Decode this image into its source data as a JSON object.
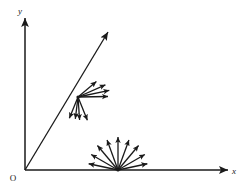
{
  "figure": {
    "kind": "vector-field-diagram",
    "width": 240,
    "height": 189,
    "background_color": "#ffffff",
    "stroke_color": "#1a1a1a"
  },
  "labels": {
    "y_axis": "y",
    "x_axis": "x",
    "origin": "O"
  },
  "chart_data": {
    "type": "scatter",
    "title": "",
    "xlabel": "x",
    "ylabel": "y",
    "grid": false,
    "legend": null,
    "axes": {
      "origin_px": [
        25,
        170
      ],
      "x_axis_end_px": [
        228,
        170
      ],
      "y_axis_end_px": [
        25,
        18
      ],
      "arrowheads": [
        "x-axis-end",
        "y-axis-end"
      ],
      "origin_label": "O",
      "x_tick_labels": [],
      "y_tick_labels": []
    },
    "annotations": [
      {
        "name": "diagonal-ray",
        "type": "arrow",
        "from_px": [
          25,
          170
        ],
        "to_px": [
          108,
          32
        ],
        "angle_deg": 59,
        "has_arrowhead": true
      }
    ],
    "series": [
      {
        "name": "upper-vector-fan",
        "vertex_px": [
          78,
          97
        ],
        "on_annotation": "diagonal-ray",
        "count": 8,
        "vectors": [
          {
            "angle_deg": 40,
            "length_px": 24
          },
          {
            "angle_deg": 24,
            "length_px": 30
          },
          {
            "angle_deg": 12,
            "length_px": 32
          },
          {
            "angle_deg": 1,
            "length_px": 30
          },
          {
            "angle_deg": 248,
            "length_px": 23
          },
          {
            "angle_deg": 263,
            "length_px": 22
          },
          {
            "angle_deg": 274,
            "length_px": 23
          },
          {
            "angle_deg": 292,
            "length_px": 25
          }
        ]
      },
      {
        "name": "lower-vector-fan",
        "vertex_px": [
          118,
          170
        ],
        "on_annotation": "x-axis",
        "count": 9,
        "vectors": [
          {
            "angle_deg": 168,
            "length_px": 30
          },
          {
            "angle_deg": 150,
            "length_px": 31
          },
          {
            "angle_deg": 130,
            "length_px": 32
          },
          {
            "angle_deg": 110,
            "length_px": 32
          },
          {
            "angle_deg": 90,
            "length_px": 33
          },
          {
            "angle_deg": 70,
            "length_px": 32
          },
          {
            "angle_deg": 50,
            "length_px": 32
          },
          {
            "angle_deg": 30,
            "length_px": 31
          },
          {
            "angle_deg": 12,
            "length_px": 30
          }
        ]
      }
    ]
  }
}
